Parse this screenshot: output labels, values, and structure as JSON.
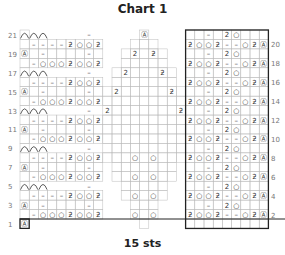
{
  "title": "Chart 1",
  "footer": "15 sts",
  "grid": {
    "cols": 27,
    "rows": 21,
    "x0": 20,
    "y0": 30,
    "cw": 9.2,
    "rh": 9.45
  },
  "row_labels_left": [
    1,
    3,
    5,
    7,
    9,
    11,
    13,
    15,
    17,
    19,
    21
  ],
  "row_labels_right": [
    2,
    4,
    6,
    8,
    10,
    12,
    14,
    16,
    18,
    20
  ],
  "symbols": {
    "purl": "–",
    "yo": "○",
    "k2tog": "ƻ",
    "ssk": "2",
    "bobble": "Ⓐ",
    "cable_arc": "⌒"
  },
  "rows": {
    "evenA_left": [
      "",
      "–",
      "○",
      "○",
      "○",
      "ƻ",
      "○",
      "○",
      "ƻ"
    ],
    "evenB_left": [
      "",
      "–",
      "–",
      "–",
      "–",
      "ƻ",
      "○",
      "○",
      "ƻ"
    ],
    "oddA_left": [
      "Ⓐ",
      "",
      "–",
      "",
      "",
      "",
      "",
      "–",
      ""
    ],
    "oddB_left": [
      "",
      "",
      "",
      "",
      "",
      "",
      "",
      "–",
      ""
    ],
    "even_right": [
      "ƻ",
      "○",
      "○",
      "ƻ",
      "–",
      "–",
      "○",
      "ƻ",
      "Ⓐ"
    ],
    "odd_right": [
      "",
      "",
      "–",
      "",
      "2",
      "○",
      "",
      "",
      ""
    ]
  },
  "colors": {
    "line": "#222222",
    "grid": "#bbbbbb",
    "text": "#333333"
  }
}
